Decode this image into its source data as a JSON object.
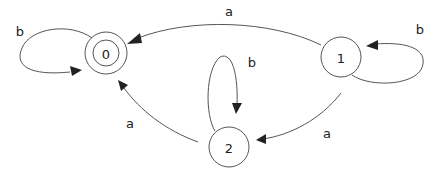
{
  "diagram": {
    "type": "finite-automaton",
    "colors": {
      "stroke": "#555555",
      "text": "#222222",
      "arrow": "#222222",
      "background": "#ffffff"
    },
    "states": [
      {
        "id": "0",
        "label": "0",
        "accepting": true
      },
      {
        "id": "1",
        "label": "1",
        "accepting": false
      },
      {
        "id": "2",
        "label": "2",
        "accepting": false
      }
    ],
    "transitions": [
      {
        "from": "0",
        "to": "0",
        "label": "b"
      },
      {
        "from": "1",
        "to": "0",
        "label": "a"
      },
      {
        "from": "1",
        "to": "1",
        "label": "b"
      },
      {
        "from": "2",
        "to": "2",
        "label": "b"
      },
      {
        "from": "2",
        "to": "0",
        "label": "a"
      },
      {
        "from": "1",
        "to": "2",
        "label": "a"
      }
    ]
  }
}
